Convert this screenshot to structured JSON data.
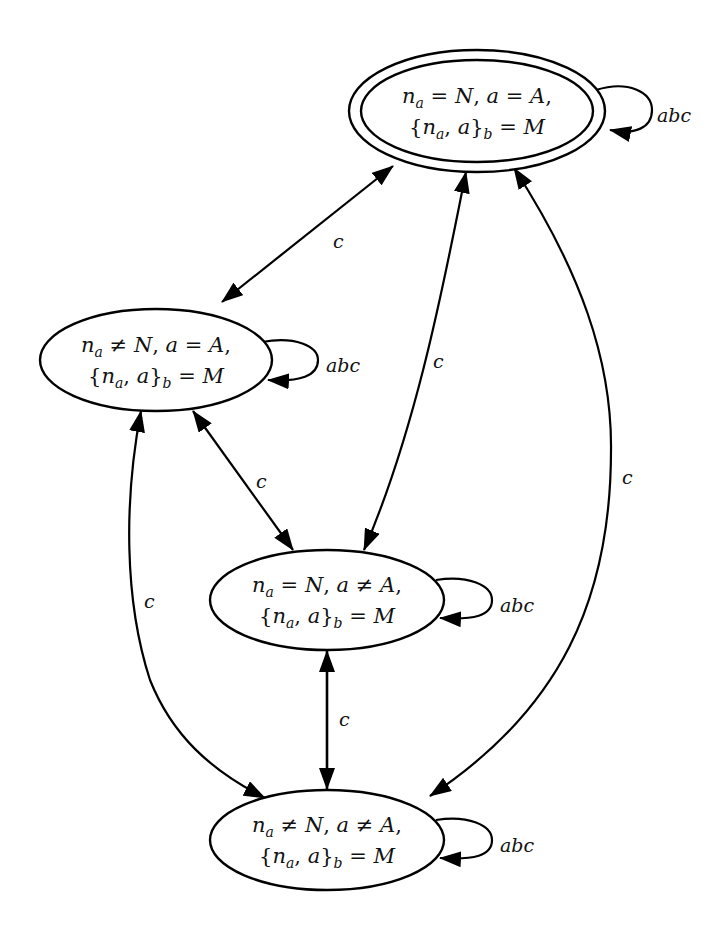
{
  "diagram": {
    "type": "state-transition-graph",
    "colors": {
      "stroke": "#000000",
      "background": "#ffffff",
      "text": "#111111"
    },
    "nodes": [
      {
        "id": "s_top",
        "accepting": true,
        "line1": {
          "na": "n",
          "na_sub": "a",
          "rel1": " = ",
          "N": "N",
          "comma": ", ",
          "a": "a",
          "rel2": " = ",
          "A": "A",
          "end": ","
        },
        "line2": {
          "open": "{",
          "na": "n",
          "na_sub": "a",
          "mid": ", ",
          "a": "a",
          "close": "}",
          "b_sub": "b",
          "eq": " = ",
          "M": "M"
        },
        "self_loop_label": "abc"
      },
      {
        "id": "s_left",
        "accepting": false,
        "line1": {
          "na": "n",
          "na_sub": "a",
          "rel1": " ≠ ",
          "N": "N",
          "comma": ", ",
          "a": "a",
          "rel2": " = ",
          "A": "A",
          "end": ","
        },
        "line2": {
          "open": "{",
          "na": "n",
          "na_sub": "a",
          "mid": ", ",
          "a": "a",
          "close": "}",
          "b_sub": "b",
          "eq": " = ",
          "M": "M"
        },
        "self_loop_label": "abc"
      },
      {
        "id": "s_mid",
        "accepting": false,
        "line1": {
          "na": "n",
          "na_sub": "a",
          "rel1": " = ",
          "N": "N",
          "comma": ", ",
          "a": "a",
          "rel2": " ≠ ",
          "A": "A",
          "end": ","
        },
        "line2": {
          "open": "{",
          "na": "n",
          "na_sub": "a",
          "mid": ", ",
          "a": "a",
          "close": "}",
          "b_sub": "b",
          "eq": " = ",
          "M": "M"
        },
        "self_loop_label": "abc"
      },
      {
        "id": "s_bottom",
        "accepting": false,
        "line1": {
          "na": "n",
          "na_sub": "a",
          "rel1": " ≠ ",
          "N": "N",
          "comma": ", ",
          "a": "a",
          "rel2": " ≠ ",
          "A": "A",
          "end": ","
        },
        "line2": {
          "open": "{",
          "na": "n",
          "na_sub": "a",
          "mid": ", ",
          "a": "a",
          "close": "}",
          "b_sub": "b",
          "eq": " = ",
          "M": "M"
        },
        "self_loop_label": "abc"
      }
    ],
    "edges": [
      {
        "from": "s_top",
        "to": "s_left",
        "label": "c",
        "bidirectional": true
      },
      {
        "from": "s_top",
        "to": "s_mid",
        "label": "c",
        "bidirectional": true
      },
      {
        "from": "s_top",
        "to": "s_bottom",
        "label": "c",
        "bidirectional": true
      },
      {
        "from": "s_left",
        "to": "s_mid",
        "label": "c",
        "bidirectional": true
      },
      {
        "from": "s_left",
        "to": "s_bottom",
        "label": "c",
        "bidirectional": true
      },
      {
        "from": "s_mid",
        "to": "s_bottom",
        "label": "c",
        "bidirectional": true
      }
    ]
  }
}
